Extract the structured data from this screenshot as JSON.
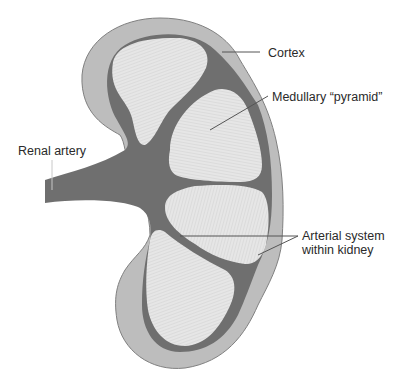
{
  "diagram": {
    "colors": {
      "background": "#ffffff",
      "cortex": "#bdbdbd",
      "cortex_outline": "#7d7d7d",
      "arterial_system": "#6f6f6f",
      "pyramid_fill": "#e4e4e4",
      "pyramid_striation": "#c8c8c8",
      "leader_line": "#555555",
      "label_text": "#2a2a2a"
    },
    "labels": {
      "cortex": "Cortex",
      "medullary_pyramid": "Medullary “pyramid”",
      "renal_artery": "Renal artery",
      "arterial_system_line1": "Arterial system",
      "arterial_system_line2": "within kidney"
    }
  }
}
